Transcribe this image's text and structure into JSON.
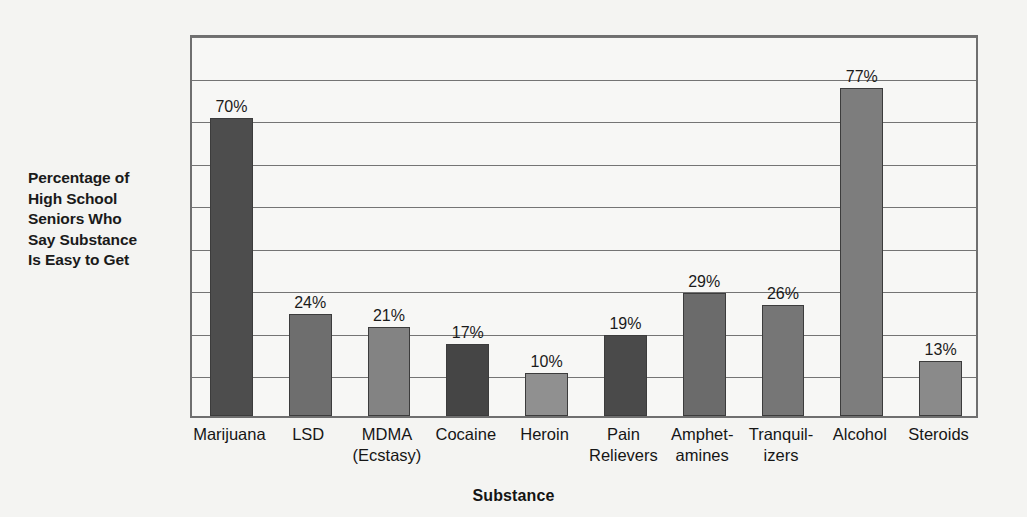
{
  "chart_data": {
    "type": "bar",
    "title": "",
    "xlabel": "Substance",
    "ylabel": "Percentage of High School Seniors Who Say Substance Is Easy to Get",
    "ylabel_lines": [
      "Percentage of",
      "High School",
      "Seniors Who",
      "Say Substance",
      "Is Easy to Get"
    ],
    "categories": [
      "Marijuana",
      "LSD",
      "MDMA (Ecstasy)",
      "Cocaine",
      "Heroin",
      "Pain Relievers",
      "Amphetamines",
      "Tranquilizers",
      "Alcohol",
      "Steroids"
    ],
    "category_label_lines": [
      [
        "Marijuana"
      ],
      [
        "LSD"
      ],
      [
        "MDMA",
        "(Ecstasy)"
      ],
      [
        "Cocaine"
      ],
      [
        "Heroin"
      ],
      [
        "Pain",
        "Relievers"
      ],
      [
        "Amphet-",
        "amines"
      ],
      [
        "Tranquil-",
        "izers"
      ],
      [
        "Alcohol"
      ],
      [
        "Steroids"
      ]
    ],
    "values": [
      70,
      24,
      21,
      17,
      10,
      19,
      29,
      26,
      77,
      13
    ],
    "value_labels": [
      "70%",
      "24%",
      "21%",
      "17%",
      "10%",
      "19%",
      "29%",
      "26%",
      "77%",
      "13%"
    ],
    "bar_colors": [
      "#4d4d4d",
      "#6e6e6e",
      "#838383",
      "#454545",
      "#909090",
      "#4a4a4a",
      "#6b6b6b",
      "#767676",
      "#7d7d7d",
      "#8a8a8a"
    ],
    "ylim": [
      0,
      90
    ],
    "y_gridline_values": [
      10,
      20,
      30,
      40,
      50,
      60,
      70,
      80,
      90
    ],
    "grid": true,
    "legend": "none",
    "axis_tick_labels_shown": false,
    "plot_border_color": "#6f6f6f",
    "background_color": "#f4f4f2",
    "plot_background_color": "#f7f7f5"
  }
}
